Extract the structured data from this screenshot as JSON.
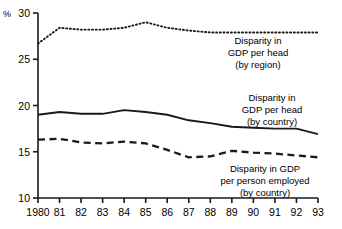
{
  "chart_data": {
    "type": "line",
    "title": "",
    "xlabel": "",
    "ylabel": "%",
    "unit_label": "%",
    "grid": false,
    "legend_position": "inline-annotations",
    "xlim": [
      1980,
      1993
    ],
    "ylim": [
      10,
      30
    ],
    "x": [
      1980,
      1981,
      1982,
      1983,
      1984,
      1985,
      1986,
      1987,
      1988,
      1989,
      1990,
      1991,
      1992,
      1993
    ],
    "xtick_labels": [
      "1980",
      "81",
      "82",
      "83",
      "84",
      "85",
      "86",
      "87",
      "88",
      "89",
      "90",
      "91",
      "92",
      "93"
    ],
    "ytick_labels": [
      "10",
      "15",
      "20",
      "25",
      "30"
    ],
    "yticks": [
      10,
      15,
      20,
      25,
      30
    ],
    "series": [
      {
        "name": "Disparity in GDP per head (by region)",
        "style": "dotted",
        "color": "#1a1a1a",
        "values": [
          26.7,
          28.4,
          28.2,
          28.2,
          28.4,
          29.0,
          28.4,
          28.1,
          27.9,
          27.9,
          27.9,
          27.9,
          27.9,
          27.9
        ]
      },
      {
        "name": "Disparity in GDP per head (by country)",
        "style": "solid",
        "color": "#1a1a1a",
        "values": [
          19.0,
          19.3,
          19.1,
          19.1,
          19.5,
          19.3,
          19.0,
          18.4,
          18.1,
          17.7,
          17.6,
          17.5,
          17.5,
          16.9
        ]
      },
      {
        "name": "Disparity in GDP per person employed (by country)",
        "style": "dashed",
        "color": "#1a1a1a",
        "values": [
          16.3,
          16.4,
          16.0,
          15.9,
          16.1,
          15.9,
          15.2,
          14.4,
          14.5,
          15.1,
          14.9,
          14.8,
          14.6,
          14.4
        ]
      }
    ],
    "annotations": [
      {
        "id": "annotation-region",
        "lines": [
          "Disparity in",
          "GDP per head",
          "(by region)"
        ],
        "x": 258,
        "y": 44
      },
      {
        "id": "annotation-country-head",
        "lines": [
          "Disparity in",
          "GDP per head",
          "(by country)"
        ],
        "x": 272,
        "y": 101
      },
      {
        "id": "annotation-country-employed",
        "lines": [
          "Disparity in GDP",
          "per person employed",
          "(by country)"
        ],
        "x": 265,
        "y": 172
      }
    ]
  }
}
